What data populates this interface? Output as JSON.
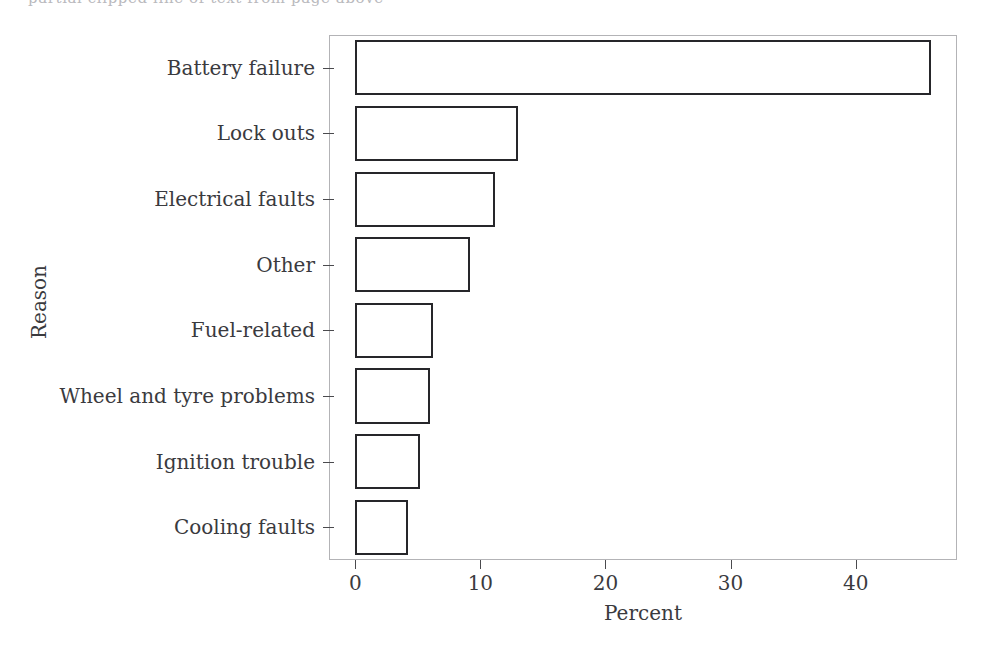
{
  "figure": {
    "top_bleed_text": "partial clipped line of text from page above",
    "background_color": "#ffffff",
    "bar_edge_color": "#26262a",
    "bar_face_color": "#ffffff",
    "frame_color": "#b3b3b6",
    "text_color": "#3a3a3e"
  },
  "chart_data": {
    "type": "bar",
    "orientation": "horizontal",
    "title": "",
    "xlabel": "Percent",
    "ylabel": "Reason",
    "categories": [
      "Battery failure",
      "Lock outs",
      "Electrical faults",
      "Other",
      "Fuel-related",
      "Wheel and tyre problems",
      "Ignition trouble",
      "Cooling faults"
    ],
    "values": [
      46,
      13,
      11.2,
      9.2,
      6.2,
      6,
      5.2,
      4.2
    ],
    "xlim": [
      -2.1,
      48.1
    ],
    "ylim": [
      0,
      8
    ],
    "xticks": [
      0,
      10,
      20,
      30,
      40
    ],
    "xticklabels": [
      "0",
      "10",
      "20",
      "30",
      "40"
    ],
    "grid": false,
    "legend": false
  }
}
